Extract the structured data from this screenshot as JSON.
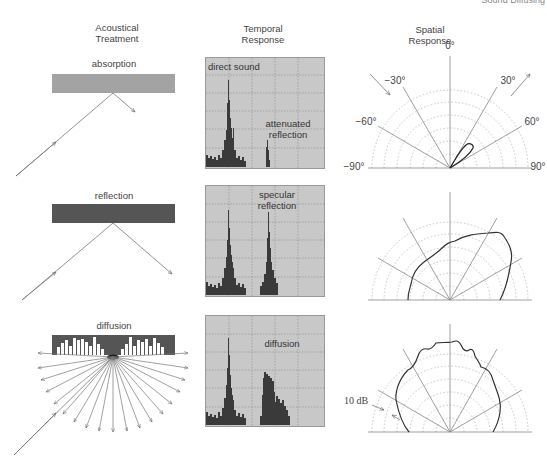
{
  "corner_text": "Sound Diffusing",
  "headers": {
    "treatment": [
      "Acoustical",
      "Treatment"
    ],
    "temporal": [
      "Temporal",
      "Response"
    ],
    "spatial": [
      "Spatial",
      "Response"
    ]
  },
  "rows": [
    {
      "treatment_label": "absorption",
      "surface_color": "#a3a3a3",
      "temporal_labels": [
        "direct sound",
        "attenuated reflection"
      ],
      "spatial_lobe": "narrow attenuated lobe at ~30°"
    },
    {
      "treatment_label": "reflection",
      "surface_color": "#555555",
      "temporal_labels": [
        "specular reflection"
      ],
      "spatial_lobe": "strong lobe toward +30°"
    },
    {
      "treatment_label": "diffusion",
      "surface_color": "#555555",
      "temporal_labels": [
        "diffusion"
      ],
      "spatial_lobe": "uniform hemispherical"
    }
  ],
  "polar_labels": {
    "zero": "0°",
    "m30": "−30°",
    "p30": "30°",
    "m60": "−60°",
    "p60": "60°",
    "m90": "−90°",
    "p90": "90°",
    "scale": "10 dB"
  },
  "colors": {
    "panel_bg": "#c8c8c8",
    "bars": "#3a3a3a",
    "grid": "#9a9a9a",
    "curve": "#333333"
  }
}
